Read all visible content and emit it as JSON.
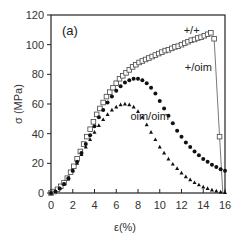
{
  "chart_data": {
    "type": "scatter",
    "title": "",
    "panel_label": "(a)",
    "xlabel": "ε(%)",
    "ylabel": "σ (MPa)",
    "xlim": [
      0,
      16
    ],
    "ylim": [
      0,
      120
    ],
    "xticks": [
      0,
      2,
      4,
      6,
      8,
      10,
      12,
      14,
      16
    ],
    "yticks": [
      0,
      20,
      40,
      60,
      80,
      100,
      120
    ],
    "grid": false,
    "legend": "inline annotations",
    "series": [
      {
        "name": "+/+",
        "marker": "open-square",
        "x": [
          0,
          0.3,
          0.6,
          0.9,
          1.2,
          1.5,
          1.8,
          2.1,
          2.4,
          2.7,
          3.0,
          3.3,
          3.6,
          3.9,
          4.2,
          4.5,
          4.8,
          5.1,
          5.4,
          5.7,
          6.0,
          6.3,
          6.6,
          6.9,
          7.2,
          7.5,
          7.8,
          8.1,
          8.4,
          8.7,
          9.0,
          9.3,
          9.6,
          9.9,
          10.2,
          10.5,
          10.8,
          11.1,
          11.4,
          11.7,
          12.0,
          12.3,
          12.6,
          12.9,
          13.2,
          13.5,
          13.8,
          14.1,
          14.4,
          14.7,
          15.0,
          15.5
        ],
        "y": [
          0,
          1,
          2.5,
          4.5,
          7,
          10,
          14,
          18,
          23,
          28,
          33,
          38,
          43,
          48,
          53,
          57,
          61,
          65,
          68,
          71,
          74,
          77,
          79,
          81,
          83,
          85,
          86.5,
          88,
          89,
          90,
          91,
          92,
          93,
          94,
          95,
          96,
          96.5,
          97.5,
          98.5,
          99,
          100,
          101,
          102,
          103,
          103.5,
          104.5,
          105,
          106,
          107,
          108,
          104,
          38
        ],
        "end_line_to": [
          15.8,
          0
        ]
      },
      {
        "name": "+/oim",
        "marker": "filled-circle",
        "x": [
          0,
          0.4,
          0.8,
          1.2,
          1.6,
          2.0,
          2.4,
          2.8,
          3.2,
          3.6,
          4.0,
          4.4,
          4.8,
          5.2,
          5.6,
          6.0,
          6.4,
          6.8,
          7.2,
          7.6,
          8.0,
          8.4,
          8.8,
          9.2,
          9.6,
          10.0,
          10.4,
          10.8,
          11.2,
          11.6,
          12.0,
          12.4,
          12.8,
          13.2,
          13.6,
          14.0,
          14.4,
          14.8,
          15.2,
          15.6,
          16.0
        ],
        "y": [
          0,
          1,
          3,
          6,
          10,
          15,
          21,
          27,
          33,
          39,
          45,
          51,
          56,
          61,
          65,
          69,
          72,
          74.5,
          76,
          77,
          77,
          76,
          74,
          71,
          67,
          62,
          57,
          52,
          47,
          42,
          38,
          34,
          31,
          28,
          25.5,
          23,
          21,
          19,
          17.5,
          16,
          15
        ]
      },
      {
        "name": "oim/oim",
        "marker": "filled-triangle",
        "x": [
          0,
          0.4,
          0.8,
          1.2,
          1.6,
          2.0,
          2.4,
          2.8,
          3.2,
          3.6,
          4.0,
          4.4,
          4.8,
          5.2,
          5.6,
          6.0,
          6.4,
          6.8,
          7.2,
          7.6,
          8.0,
          8.4,
          8.8,
          9.2,
          9.6,
          10.0,
          10.4,
          10.8,
          11.2,
          11.6,
          12.0,
          12.4,
          12.8,
          13.2,
          13.6,
          14.0,
          14.4,
          14.8,
          15.2,
          15.6,
          16.0
        ],
        "y": [
          0,
          1,
          3,
          6,
          10,
          15,
          20,
          26,
          31,
          36,
          41,
          45.5,
          49.5,
          53,
          56,
          58,
          59.5,
          60,
          59.5,
          58,
          55,
          51,
          46,
          41,
          36,
          31,
          27,
          23,
          19.5,
          16.5,
          13.5,
          11,
          9,
          7,
          5.5,
          4,
          3,
          2,
          1.3,
          0.7,
          0.3
        ]
      }
    ],
    "annotations": [
      {
        "text": "+/+",
        "x": 12.2,
        "y": 107
      },
      {
        "text": "+/oim",
        "x": 12.3,
        "y": 82
      },
      {
        "text": "oim/oim",
        "x": 7.3,
        "y": 49
      }
    ]
  }
}
